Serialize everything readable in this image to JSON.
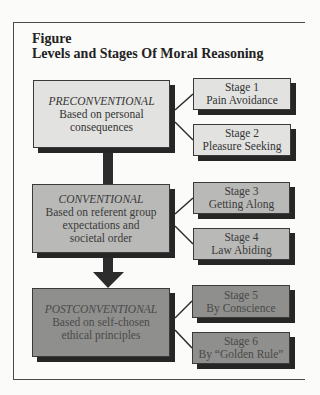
{
  "figure": {
    "label": "Figure",
    "title": "Levels and Stages Of Moral Reasoning"
  },
  "levels": [
    {
      "name": "PRECONVENTIONAL",
      "description_lines": [
        "Based on personal",
        "consequences"
      ],
      "stages": [
        {
          "number": "Stage 1",
          "name": "Pain Avoidance"
        },
        {
          "number": "Stage 2",
          "name": "Pleasure Seeking"
        }
      ]
    },
    {
      "name": "CONVENTIONAL",
      "description_lines": [
        "Based on referent group",
        "expectations and",
        "societal order"
      ],
      "stages": [
        {
          "number": "Stage 3",
          "name": "Getting Along"
        },
        {
          "number": "Stage 4",
          "name": "Law Abiding"
        }
      ]
    },
    {
      "name": "POSTCONVENTIONAL",
      "description_lines": [
        "Based on self-chosen",
        "ethical principles"
      ],
      "stages": [
        {
          "number": "Stage 5",
          "name": "By Conscience"
        },
        {
          "number": "Stage 6",
          "name": "By “Golden Rule”"
        }
      ]
    }
  ],
  "colors": {
    "level1_fill": "#e2e2e0",
    "level2_fill": "#b9b9b7",
    "level3_fill": "#8f8f8d",
    "shadow": "#262626",
    "connector": "#2c2c2c"
  }
}
